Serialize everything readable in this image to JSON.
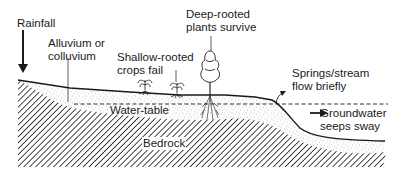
{
  "diagram": {
    "title": "",
    "labels": {
      "rainfall": "Rainfall",
      "alluvium_line1": "Alluvium or",
      "alluvium_line2": "colluvium",
      "shallow_line1": "Shallow-rooted",
      "shallow_line2": "crops fail",
      "deep_line1": "Deep-rooted",
      "deep_line2": "plants survive",
      "springs_line1": "Springs/stream",
      "springs_line2": "flow briefly",
      "water_table": "Water-table",
      "groundwater_line1": "Groundwater",
      "groundwater_line2": "seeps sway",
      "bedrock": "Bedrock"
    },
    "colors": {
      "ink": "#1a1a1a",
      "background": "#ffffff",
      "stipple": "#8a8a8a"
    }
  }
}
